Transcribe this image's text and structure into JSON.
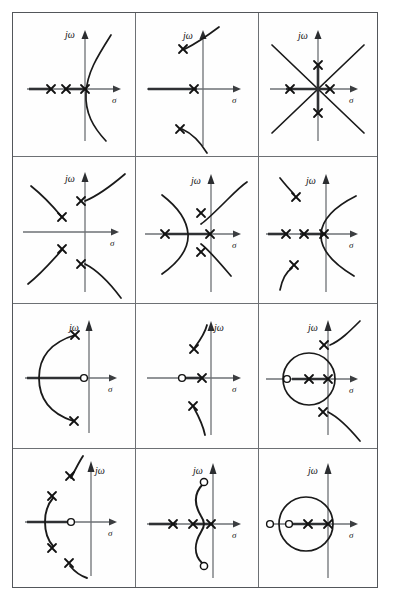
{
  "figure": {
    "type": "root-locus-plate",
    "grid": {
      "rows": 4,
      "columns": 3,
      "cells": 12
    },
    "axis_labels": {
      "imaginary": "jω",
      "real": "σ"
    },
    "symbols": {
      "pole": "x",
      "zero": "o",
      "pole_name": "pole-marker",
      "zero_name": "zero-marker"
    },
    "colors": {
      "ink": "#1a1a1a",
      "axis": "#6d7074",
      "frame": "#53565a",
      "background": "#ffffff"
    }
  },
  "cells": [
    {
      "id": "cell-r1c1",
      "row": 1,
      "column": 1,
      "title": "Three real poles, breakaway into a single pair going to infinity",
      "poles_real": 3,
      "zeros_real": 0,
      "zeros_complex": 0,
      "branches": "one breakaway arc crossing the jω axis",
      "real_axis_label": "σ",
      "imag_axis_label": "jω"
    },
    {
      "id": "cell-r1c2",
      "row": 1,
      "column": 2,
      "title": "One real pole plus a complex conjugate pole pair",
      "poles_real": 1,
      "poles_complex": 2,
      "zeros_real": 0,
      "branches": "two arcs departing from the complex poles toward infinity",
      "real_axis_label": "σ",
      "imag_axis_label": "jω"
    },
    {
      "id": "cell-r1c3",
      "row": 1,
      "column": 3,
      "title": "Four poles at symmetric positions about the origin, asymptotes at 45 degrees",
      "poles_real": 2,
      "poles_imaginary": 2,
      "zeros_real": 0,
      "branches": "four straight asymptotic branches crossing at the origin",
      "real_axis_label": "σ",
      "imag_axis_label": "jω"
    },
    {
      "id": "cell-r2c1",
      "row": 2,
      "column": 1,
      "title": "Two complex conjugate pole pairs with four diverging branches",
      "poles_complex": 4,
      "zeros_real": 0,
      "branches": "four curved branches, upper pair bending right, lower pair bending right",
      "real_axis_label": "σ",
      "imag_axis_label": "jω"
    },
    {
      "id": "cell-r2c2",
      "row": 2,
      "column": 2,
      "title": "Two real poles and a complex conjugate pair; breakaway point between the real poles",
      "poles_real": 2,
      "poles_complex": 2,
      "zeros_real": 0,
      "branches": "breakaway into two branches plus two branches from the complex poles",
      "real_axis_label": "σ",
      "imag_axis_label": "jω"
    },
    {
      "id": "cell-r2c3",
      "row": 2,
      "column": 3,
      "title": "Three real poles and a complex conjugate pair",
      "poles_real": 3,
      "poles_complex": 2,
      "zeros_real": 0,
      "branches": "breakaway arc at the rightmost real pole plus two complex branches",
      "real_axis_label": "σ",
      "imag_axis_label": "jω"
    },
    {
      "id": "cell-r3c1",
      "row": 3,
      "column": 1,
      "title": "Complex conjugate poles and one real zero, locus is a left-opening arc",
      "poles_complex": 2,
      "zeros_real": 1,
      "branches": "single circular arc terminating on the real axis",
      "real_axis_label": "σ",
      "imag_axis_label": "jω"
    },
    {
      "id": "cell-r3c2",
      "row": 3,
      "column": 2,
      "title": "One real pole, one real zero and a complex conjugate pole pair",
      "poles_real": 1,
      "poles_complex": 2,
      "zeros_real": 1,
      "branches": "real axis segment between zero and pole plus two complex branches",
      "real_axis_label": "σ",
      "imag_axis_label": "jω"
    },
    {
      "id": "cell-r3c3",
      "row": 3,
      "column": 3,
      "title": "Circular locus about a real pole and zero plus a complex conjugate pole pair",
      "poles_real": 2,
      "poles_complex": 2,
      "zeros_real": 1,
      "branches": "a complete circle on the real axis plus two diverging complex branches",
      "real_axis_label": "σ",
      "imag_axis_label": "jω"
    },
    {
      "id": "cell-r4c1",
      "row": 4,
      "column": 1,
      "title": "Two complex pole pairs and one real zero with a short vertical arc",
      "poles_complex": 4,
      "zeros_real": 1,
      "branches": "short arc joining a near pole pair plus two outer complex branches",
      "real_axis_label": "σ",
      "imag_axis_label": "jω"
    },
    {
      "id": "cell-r4c2",
      "row": 4,
      "column": 2,
      "title": "Three real poles and a complex conjugate zero pair",
      "poles_real": 3,
      "zeros_complex": 2,
      "branches": "S-shaped locus from the real axis terminating on the complex zeros",
      "real_axis_label": "σ",
      "imag_axis_label": "jω"
    },
    {
      "id": "cell-r4c3",
      "row": 4,
      "column": 3,
      "title": "Two real zeros and two real poles producing a circular locus",
      "poles_real": 2,
      "zeros_real": 2,
      "branches": "a complete circle about the inner zero and pole",
      "real_axis_label": "σ",
      "imag_axis_label": "jω"
    }
  ]
}
